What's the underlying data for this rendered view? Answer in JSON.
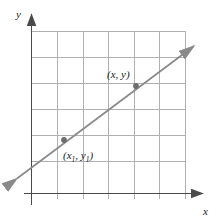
{
  "figure": {
    "kind": "coordinate-grid-line-graph",
    "background_color": "#ffffff",
    "axes": {
      "x_label": "x",
      "y_label": "y",
      "axis_color": "#4a4a4a",
      "origin": {
        "x": 31,
        "y": 193
      },
      "x_axis_end": {
        "x": 207,
        "y": 193
      },
      "y_axis_end": {
        "x": 31,
        "y": 9
      }
    },
    "grid": {
      "color": "#b0b0b0",
      "spacing": 25.7,
      "columns": 6,
      "rows": 6,
      "x_positions": [
        31,
        57,
        83,
        108,
        134,
        159,
        185
      ],
      "y_positions": [
        31,
        57,
        83,
        109,
        135,
        161,
        193
      ],
      "left": 31,
      "right": 185,
      "top": 31,
      "bottom": 193
    },
    "line": {
      "color": "#8a8a8a",
      "slope": 0.747,
      "start": {
        "x": 14,
        "y": 181
      },
      "end": {
        "x": 197,
        "y": 44
      },
      "arrow_start": true,
      "arrow_end": true
    },
    "points": [
      {
        "name": "point-x1-y1",
        "label": "(x",
        "label_sub": "1",
        "label_mid": ", y",
        "label_sub2": "1",
        "label_end": ")",
        "cx": 64,
        "cy": 140,
        "r": 3,
        "color": "#6e6e6e",
        "label_x": 63,
        "label_y": 158
      },
      {
        "name": "point-x-y",
        "label": "(x, y)",
        "cx": 136,
        "cy": 86,
        "r": 3,
        "color": "#6e6e6e",
        "label_x": 107,
        "label_y": 78
      }
    ]
  }
}
